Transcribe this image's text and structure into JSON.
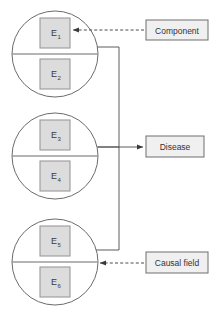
{
  "diagram": {
    "colors": {
      "background": "#ffffff",
      "circle_stroke": "#5a5a5a",
      "element_fill": "#dcdcdc",
      "element_stroke": "#9a9a9a",
      "connector_stroke": "#4a4a4a",
      "label_fill": "#f0f0f0",
      "label_stroke": "#6e6e6e",
      "text": "#333333"
    },
    "circles": [
      {
        "id": "circle-1",
        "cx": 55,
        "cy": 54,
        "r": 43,
        "divider_y": 54,
        "elements": [
          {
            "id": "e1",
            "base": "E",
            "sub": "1",
            "label": "E1",
            "x": 40,
            "y": 18,
            "w": 30,
            "h": 30
          },
          {
            "id": "e2",
            "base": "E",
            "sub": "2",
            "label": "E2",
            "x": 40,
            "y": 59,
            "w": 30,
            "h": 30
          }
        ]
      },
      {
        "id": "circle-2",
        "cx": 55,
        "cy": 156,
        "r": 43,
        "divider_y": 156,
        "elements": [
          {
            "id": "e3",
            "base": "E",
            "sub": "3",
            "label": "E3",
            "x": 40,
            "y": 120,
            "w": 30,
            "h": 30
          },
          {
            "id": "e4",
            "base": "E",
            "sub": "4",
            "label": "E4",
            "x": 40,
            "y": 161,
            "w": 30,
            "h": 30
          }
        ]
      },
      {
        "id": "circle-3",
        "cx": 55,
        "cy": 262,
        "r": 43,
        "divider_y": 262,
        "elements": [
          {
            "id": "e5",
            "base": "E",
            "sub": "5",
            "label": "E5",
            "x": 40,
            "y": 226,
            "w": 30,
            "h": 30
          },
          {
            "id": "e6",
            "base": "E",
            "sub": "6",
            "label": "E6",
            "x": 40,
            "y": 267,
            "w": 30,
            "h": 30
          }
        ]
      }
    ],
    "labels": [
      {
        "id": "component",
        "text": "Component",
        "x": 146,
        "y": 20,
        "w": 62,
        "h": 20,
        "arrow": {
          "from_x": 144,
          "from_y": 30,
          "to_x": 71,
          "to_y": 30,
          "style": "dashed"
        }
      },
      {
        "id": "disease",
        "text": "Disease",
        "x": 146,
        "y": 136,
        "w": 58,
        "h": 21,
        "arrow": {
          "from_x": 98,
          "from_y": 147,
          "to_x": 144,
          "to_y": 147,
          "style": "solid"
        }
      },
      {
        "id": "causal-field",
        "text": "Causal field",
        "x": 146,
        "y": 252,
        "w": 62,
        "h": 21,
        "arrow": {
          "from_x": 144,
          "from_y": 263,
          "to_x": 98,
          "to_y": 263,
          "style": "dashed"
        }
      }
    ],
    "bracket": {
      "vertical_x": 119,
      "top_y": 47,
      "bottom_y": 250,
      "stub_top": {
        "x1": 96,
        "y1": 47,
        "x2": 119,
        "y2": 47
      },
      "stub_mid": {
        "x1": 96,
        "y1": 147,
        "x2": 119,
        "y2": 147
      },
      "stub_bottom": {
        "x1": 96,
        "y1": 250,
        "x2": 119,
        "y2": 250
      }
    }
  }
}
